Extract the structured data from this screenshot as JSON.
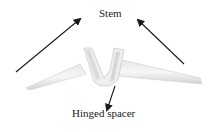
{
  "diagram": {
    "labels": {
      "stem": "Stem",
      "hinged_spacer": "Hinged spacer"
    },
    "colors": {
      "arrow": "#1a1a1a",
      "implant_light": "#f2f2f2",
      "implant_mid": "#dcdcdc",
      "implant_shadow": "#c4c4c4",
      "text": "#222222"
    }
  }
}
